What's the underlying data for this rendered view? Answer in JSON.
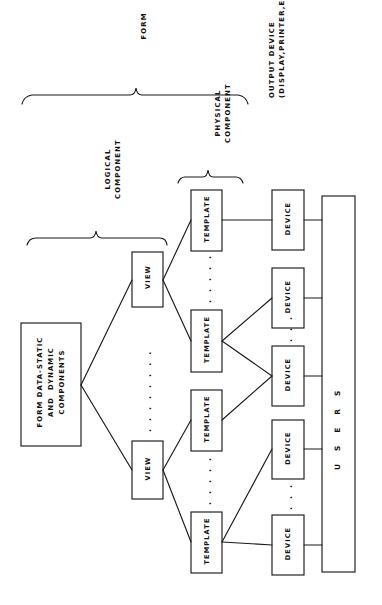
{
  "diagram": {
    "title_brace": "FORM",
    "orientation": "rotated-90-ccw",
    "background_color": "#ffffff",
    "line_color": "#1a1a1a",
    "braces": [
      {
        "name": "form",
        "label": "FORM"
      },
      {
        "name": "logical-component",
        "label": "LOGICAL\nCOMPONENT"
      },
      {
        "name": "physical-component",
        "label": "PHYSICAL\nCOMPONENT"
      }
    ],
    "annotations": [
      {
        "name": "output-device",
        "label": "OUTPUT DEVICE\n(DISPLAY,PRINTER,ETC.)"
      }
    ],
    "nodes": {
      "source": {
        "label": "FORM DATA-STATIC\nAND  DYNAMIC\nCOMPONENTS"
      },
      "views": [
        {
          "label": "VIEW"
        },
        {
          "label": "VIEW"
        }
      ],
      "templates": [
        {
          "label": "TEMPLATE"
        },
        {
          "label": "TEMPLATE"
        },
        {
          "label": "TEMPLATE"
        },
        {
          "label": "TEMPLATE"
        }
      ],
      "devices": [
        {
          "label": "DEVICE"
        },
        {
          "label": "DEVICE"
        },
        {
          "label": "DEVICE"
        },
        {
          "label": "DEVICE"
        },
        {
          "label": "DEVICE"
        }
      ],
      "users_bar": {
        "label": "U S E R S"
      }
    },
    "ellipses": {
      "views_gap": ". . . . . . . .",
      "templates_gap_1": ". . . . .",
      "templates_gap_2": ". . . . .",
      "devices_gap_1": ". . .",
      "devices_gap_2": ". . ."
    }
  }
}
